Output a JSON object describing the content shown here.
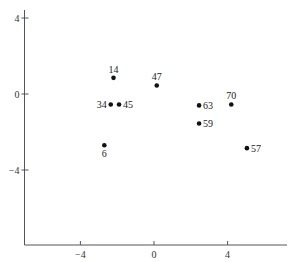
{
  "chart_data": {
    "type": "scatter",
    "title": "",
    "xlabel": "",
    "ylabel": "",
    "xlim": [
      -7.1,
      7.2
    ],
    "ylim": [
      -7.9,
      4.4
    ],
    "grid": false,
    "legend": null,
    "x_ticks": [
      -4,
      0,
      4
    ],
    "x_tick_labels": [
      "−4",
      "0",
      "4"
    ],
    "y_ticks": [
      4,
      0,
      -4
    ],
    "y_tick_labels": [
      "4",
      "0",
      "−4"
    ],
    "points": [
      {
        "label": "14",
        "x": -2.2,
        "y": 0.85,
        "label_pos": "above"
      },
      {
        "label": "34",
        "x": -2.35,
        "y": -0.55,
        "label_pos": "left"
      },
      {
        "label": "45",
        "x": -1.9,
        "y": -0.55,
        "label_pos": "right"
      },
      {
        "label": "47",
        "x": 0.15,
        "y": 0.45,
        "label_pos": "above"
      },
      {
        "label": "63",
        "x": 2.45,
        "y": -0.6,
        "label_pos": "right"
      },
      {
        "label": "70",
        "x": 4.2,
        "y": -0.55,
        "label_pos": "above"
      },
      {
        "label": "59",
        "x": 2.45,
        "y": -1.55,
        "label_pos": "right"
      },
      {
        "label": "6",
        "x": -2.7,
        "y": -2.7,
        "label_pos": "below"
      },
      {
        "label": "57",
        "x": 5.05,
        "y": -2.85,
        "label_pos": "right"
      }
    ]
  },
  "layout": {
    "origin_px": {
      "x": 154,
      "y": 94
    },
    "px_per_unit": {
      "x": 18.4,
      "y": 19
    },
    "x_axis_y_px": 245,
    "y_axis_x_px": 24.5,
    "x_axis_right_px": 287,
    "y_axis_top_px": 10
  }
}
